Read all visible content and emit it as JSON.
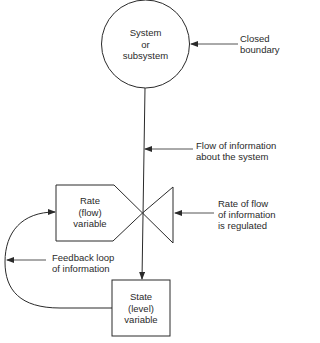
{
  "diagram": {
    "nodes": {
      "system": {
        "line1": "System",
        "line2": "or",
        "line3": "subsystem",
        "shape": "circle"
      },
      "rate": {
        "line1": "Rate",
        "line2": "(flow)",
        "line3": "variable",
        "shape": "pentagon"
      },
      "state": {
        "line1": "State",
        "line2": "(level)",
        "line3": "variable",
        "shape": "rectangle"
      }
    },
    "annotations": {
      "closed_boundary": {
        "line1": "Closed",
        "line2": "boundary"
      },
      "flow_info": {
        "line1": "Flow of information",
        "line2": "about the system"
      },
      "rate_regulated": {
        "line1": "Rate of flow",
        "line2": "of information",
        "line3": "is regulated"
      },
      "feedback_loop": {
        "line1": "Feedback loop",
        "line2": "of information"
      }
    },
    "colors": {
      "stroke": "#2a2a2a",
      "background": "#ffffff"
    }
  }
}
